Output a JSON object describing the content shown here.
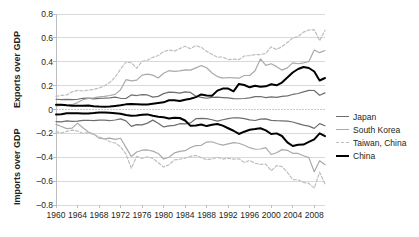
{
  "chart_data": {
    "type": "line",
    "title": "",
    "subtitle": "",
    "xlabel": "",
    "ylabel_top": "Exports over GDP",
    "ylabel_bottom": "Imports over GDP",
    "ylim": [
      -0.8,
      0.8
    ],
    "xlim": [
      1960,
      2010
    ],
    "yticks": [
      "0.8",
      "0.6",
      "0.4",
      "0.2",
      "0",
      "-0.2",
      "-0.4",
      "-0.6",
      "-0.8"
    ],
    "ytick_values": [
      0.8,
      0.6,
      0.4,
      0.2,
      0,
      -0.2,
      -0.4,
      -0.6,
      -0.8
    ],
    "xticks": [
      "1960",
      "1964",
      "1968",
      "1972",
      "1976",
      "1980",
      "1984",
      "1988",
      "1992",
      "1996",
      "2000",
      "2004",
      "2008"
    ],
    "xtick_values": [
      1960,
      1964,
      1968,
      1972,
      1976,
      1980,
      1984,
      1988,
      1992,
      1996,
      2000,
      2004,
      2008
    ],
    "grid": true,
    "legend_position": "right",
    "colors": {
      "japan": "#6d6e71",
      "south_korea": "#a7a9ac",
      "taiwan_china": "#bcbec0",
      "china": "#000000",
      "grid": "#d8d9da",
      "axis": "#bcbec0",
      "zero_line": "#c9cbcd"
    },
    "legend": [
      {
        "name": "Japan",
        "style": "solid",
        "color": "#6d6e71",
        "width": 1.2
      },
      {
        "name": "South Korea",
        "style": "solid",
        "color": "#a7a9ac",
        "width": 1.2
      },
      {
        "name": "Taiwan, China",
        "style": "dashed",
        "color": "#bcbec0",
        "width": 1.2
      },
      {
        "name": "China",
        "style": "solid",
        "color": "#000000",
        "width": 2.0
      }
    ],
    "x": [
      1960,
      1961,
      1962,
      1963,
      1964,
      1965,
      1966,
      1967,
      1968,
      1969,
      1970,
      1971,
      1972,
      1973,
      1974,
      1975,
      1976,
      1977,
      1978,
      1979,
      1980,
      1981,
      1982,
      1983,
      1984,
      1985,
      1986,
      1987,
      1988,
      1989,
      1990,
      1991,
      1992,
      1993,
      1994,
      1995,
      1996,
      1997,
      1998,
      1999,
      2000,
      2001,
      2002,
      2003,
      2004,
      2005,
      2006,
      2007,
      2008,
      2009,
      2010
    ],
    "series": [
      {
        "name": "Japan",
        "panel": "exports",
        "values": [
          0.086,
          0.082,
          0.084,
          0.083,
          0.086,
          0.094,
          0.096,
          0.089,
          0.093,
          0.095,
          0.098,
          0.103,
          0.094,
          0.092,
          0.122,
          0.117,
          0.125,
          0.122,
          0.104,
          0.11,
          0.133,
          0.146,
          0.144,
          0.137,
          0.148,
          0.143,
          0.111,
          0.101,
          0.094,
          0.101,
          0.103,
          0.1,
          0.097,
          0.091,
          0.09,
          0.092,
          0.097,
          0.108,
          0.109,
          0.1,
          0.106,
          0.102,
          0.11,
          0.114,
          0.126,
          0.134,
          0.148,
          0.16,
          0.159,
          0.119,
          0.139
        ]
      },
      {
        "name": "South Korea",
        "panel": "exports",
        "values": [
          0.03,
          0.035,
          0.035,
          0.04,
          0.058,
          0.082,
          0.093,
          0.097,
          0.106,
          0.11,
          0.117,
          0.127,
          0.166,
          0.25,
          0.24,
          0.246,
          0.288,
          0.296,
          0.288,
          0.264,
          0.304,
          0.325,
          0.32,
          0.324,
          0.332,
          0.33,
          0.349,
          0.368,
          0.35,
          0.306,
          0.276,
          0.263,
          0.268,
          0.265,
          0.262,
          0.285,
          0.285,
          0.325,
          0.424,
          0.37,
          0.383,
          0.359,
          0.33,
          0.349,
          0.391,
          0.383,
          0.39,
          0.402,
          0.498,
          0.476,
          0.494
        ]
      },
      {
        "name": "Taiwan, China",
        "panel": "exports",
        "values": [
          0.11,
          0.118,
          0.122,
          0.148,
          0.16,
          0.155,
          0.162,
          0.168,
          0.18,
          0.198,
          0.227,
          0.271,
          0.339,
          0.397,
          0.393,
          0.345,
          0.404,
          0.412,
          0.437,
          0.452,
          0.485,
          0.499,
          0.489,
          0.51,
          0.53,
          0.509,
          0.535,
          0.521,
          0.487,
          0.462,
          0.438,
          0.44,
          0.418,
          0.422,
          0.418,
          0.448,
          0.452,
          0.46,
          0.46,
          0.47,
          0.525,
          0.502,
          0.527,
          0.561,
          0.6,
          0.61,
          0.648,
          0.666,
          0.669,
          0.577,
          0.663
        ]
      },
      {
        "name": "China",
        "panel": "exports",
        "values": [
          0.04,
          0.04,
          0.035,
          0.032,
          0.032,
          0.032,
          0.033,
          0.028,
          0.025,
          0.024,
          0.026,
          0.03,
          0.035,
          0.043,
          0.047,
          0.045,
          0.042,
          0.042,
          0.048,
          0.054,
          0.06,
          0.077,
          0.077,
          0.072,
          0.082,
          0.09,
          0.104,
          0.126,
          0.118,
          0.116,
          0.158,
          0.175,
          0.175,
          0.152,
          0.214,
          0.205,
          0.186,
          0.199,
          0.19,
          0.194,
          0.211,
          0.203,
          0.226,
          0.268,
          0.31,
          0.339,
          0.356,
          0.348,
          0.318,
          0.243,
          0.264
        ]
      },
      {
        "name": "Japan",
        "panel": "imports",
        "values": [
          -0.101,
          -0.104,
          -0.096,
          -0.1,
          -0.098,
          -0.091,
          -0.09,
          -0.093,
          -0.089,
          -0.089,
          -0.094,
          -0.088,
          -0.079,
          -0.095,
          -0.141,
          -0.127,
          -0.129,
          -0.114,
          -0.089,
          -0.115,
          -0.146,
          -0.137,
          -0.133,
          -0.119,
          -0.12,
          -0.112,
          -0.077,
          -0.075,
          -0.077,
          -0.086,
          -0.098,
          -0.086,
          -0.077,
          -0.069,
          -0.07,
          -0.076,
          -0.087,
          -0.092,
          -0.081,
          -0.079,
          -0.091,
          -0.094,
          -0.095,
          -0.097,
          -0.105,
          -0.118,
          -0.131,
          -0.139,
          -0.158,
          -0.118,
          -0.136
        ]
      },
      {
        "name": "South Korea",
        "panel": "imports",
        "values": [
          -0.125,
          -0.142,
          -0.16,
          -0.156,
          -0.114,
          -0.153,
          -0.188,
          -0.205,
          -0.24,
          -0.246,
          -0.24,
          -0.25,
          -0.241,
          -0.317,
          -0.394,
          -0.356,
          -0.341,
          -0.339,
          -0.349,
          -0.368,
          -0.415,
          -0.4,
          -0.364,
          -0.351,
          -0.345,
          -0.319,
          -0.302,
          -0.3,
          -0.273,
          -0.27,
          -0.287,
          -0.298,
          -0.288,
          -0.277,
          -0.283,
          -0.3,
          -0.32,
          -0.333,
          -0.331,
          -0.319,
          -0.377,
          -0.362,
          -0.336,
          -0.342,
          -0.367,
          -0.368,
          -0.387,
          -0.403,
          -0.521,
          -0.43,
          -0.462
        ]
      },
      {
        "name": "Taiwan, China",
        "panel": "imports",
        "values": [
          -0.186,
          -0.196,
          -0.183,
          -0.173,
          -0.18,
          -0.2,
          -0.196,
          -0.208,
          -0.231,
          -0.243,
          -0.27,
          -0.281,
          -0.312,
          -0.373,
          -0.492,
          -0.393,
          -0.41,
          -0.396,
          -0.41,
          -0.445,
          -0.482,
          -0.463,
          -0.422,
          -0.417,
          -0.407,
          -0.393,
          -0.385,
          -0.403,
          -0.42,
          -0.414,
          -0.4,
          -0.415,
          -0.409,
          -0.416,
          -0.413,
          -0.444,
          -0.427,
          -0.45,
          -0.46,
          -0.457,
          -0.514,
          -0.47,
          -0.478,
          -0.527,
          -0.587,
          -0.589,
          -0.611,
          -0.619,
          -0.659,
          -0.525,
          -0.624
        ]
      },
      {
        "name": "China",
        "panel": "imports",
        "values": [
          -0.042,
          -0.04,
          -0.032,
          -0.032,
          -0.032,
          -0.033,
          -0.033,
          -0.03,
          -0.026,
          -0.025,
          -0.028,
          -0.031,
          -0.035,
          -0.046,
          -0.053,
          -0.051,
          -0.044,
          -0.041,
          -0.053,
          -0.061,
          -0.065,
          -0.076,
          -0.07,
          -0.071,
          -0.092,
          -0.137,
          -0.134,
          -0.125,
          -0.139,
          -0.128,
          -0.121,
          -0.135,
          -0.157,
          -0.178,
          -0.205,
          -0.186,
          -0.17,
          -0.164,
          -0.157,
          -0.175,
          -0.205,
          -0.2,
          -0.222,
          -0.275,
          -0.306,
          -0.296,
          -0.294,
          -0.272,
          -0.25,
          -0.2,
          -0.223
        ]
      }
    ]
  },
  "axes": {
    "exports_label": "Exports over GDP",
    "imports_label": "Imports over GDP"
  },
  "legend": {
    "items": [
      {
        "label": "Japan"
      },
      {
        "label": "South Korea"
      },
      {
        "label": "Taiwan, China"
      },
      {
        "label": "China"
      }
    ]
  }
}
